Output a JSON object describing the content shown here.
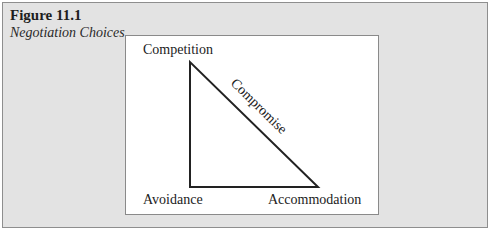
{
  "figure": {
    "number": "Figure 11.1",
    "title": "Negotiation Choices"
  },
  "diagram": {
    "shape": "right-triangle",
    "vertices": {
      "top": "Competition",
      "bottom_left": "Avoidance",
      "bottom_right": "Accommodation"
    },
    "hypotenuse_label": "Compromise",
    "colors": {
      "frame_bg": "#e3e3e3",
      "panel_bg": "#ffffff",
      "line": "#222222"
    }
  }
}
